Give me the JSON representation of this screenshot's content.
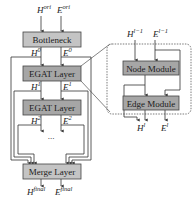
{
  "diagram": {
    "colors": {
      "box_light": "#c8c8c8",
      "box_dark": "#9a9a9a",
      "stroke": "#333333",
      "background": "#ffffff"
    },
    "inputs": {
      "h": "H",
      "h_sup": "ori",
      "e": "E",
      "e_sup": "ori"
    },
    "left_column": {
      "bottleneck": "Bottleneck",
      "egat1": "EGAT Layer",
      "egat2": "EGAT Layer",
      "merge": "Merge Layer",
      "ellipsis": "...",
      "h0": "H",
      "h0_sup": "0",
      "e0": "E",
      "e0_sup": "0",
      "h1": "H",
      "h1_sup": "1",
      "e1": "E",
      "e1_sup": "1",
      "h2": "H",
      "h2_sup": "2",
      "e2": "E",
      "e2_sup": "2"
    },
    "outputs": {
      "h": "H",
      "h_sup": "final",
      "e": "E",
      "e_sup": "final"
    },
    "detail_panel": {
      "in_h": "H",
      "in_h_sup": "l−1",
      "in_e": "E",
      "in_e_sup": "l−1",
      "node_module": "Node Module",
      "edge_module": "Edge Module",
      "out_h": "H",
      "out_h_sup": "l",
      "out_e": "E",
      "out_e_sup": "l"
    }
  }
}
